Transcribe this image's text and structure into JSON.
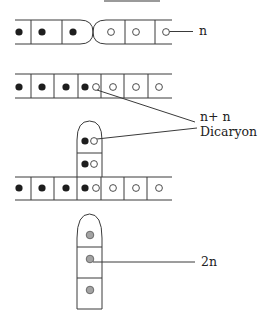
{
  "diagram": {
    "type": "fungal hyphae fusion / dikaryon formation",
    "labels": {
      "haploid": "n",
      "dikaryon_line1": "n+ n",
      "dikaryon_line2": "Dicaryon",
      "diploid": "2n"
    },
    "colors": {
      "line": "#3a3a3a",
      "nucleus_plus": "#1e1e1e",
      "nucleus_minus": "#ffffff",
      "nucleus_diploid": "#a3a3a3"
    },
    "stages": [
      {
        "name": "plasmogamy-contact",
        "cells_left": 3,
        "cells_right": 3,
        "nuclei_left": "dark",
        "nuclei_right": "open"
      },
      {
        "name": "fused-hypha",
        "cells": 7,
        "dikaryotic_cell_index": 3
      },
      {
        "name": "dikaryotic-branch",
        "branch_cells": 2,
        "base_cells": 7
      },
      {
        "name": "diploid-cells",
        "cells": 3,
        "nuclei": "gray"
      }
    ]
  }
}
